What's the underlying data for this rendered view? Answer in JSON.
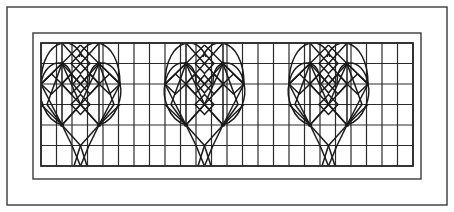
{
  "figure": {
    "kind": "geometric-line-drawing",
    "canvas": {
      "width": 454,
      "height": 212
    },
    "background_color": "#ffffff",
    "line_color": "#1a1a1a",
    "grid_line_color": "#2b2b2b",
    "frame_color": "#3a3a3a"
  },
  "frames": [
    {
      "name": "outer-frame",
      "x": 7,
      "y": 7,
      "width": 440,
      "height": 198,
      "stroke_width": 1.4
    },
    {
      "name": "middle-frame",
      "x": 33,
      "y": 33,
      "width": 388,
      "height": 146,
      "stroke_width": 1.4
    },
    {
      "name": "inner-grid-frame",
      "x": 41,
      "y": 43,
      "width": 372,
      "height": 123,
      "stroke_width": 1.8
    }
  ],
  "grid": {
    "x": 41,
    "y": 43,
    "width": 372,
    "height": 123,
    "columns": 24,
    "rows": 6,
    "cell_width": 15.5,
    "cell_height": 20.5,
    "stroke_width": 1.2
  },
  "motif": {
    "name": "heart-with-diamond-lattice",
    "repeat_count": 3,
    "repeat_period_px": 124,
    "first_origin_x": 41,
    "origin_y": 43,
    "description": "A heart outline formed of arcs and straight chords, filled with a lattice of rotated squares (diamonds) and radiating spokes, with a V-shaped tail dropping below the heart point.",
    "motif_width": 124,
    "motif_height": 123
  },
  "chart_data": {
    "type": "table",
    "xlabel": "",
    "ylabel": "",
    "categories": [
      "motif-1",
      "motif-2",
      "motif-3"
    ],
    "values": [
      1,
      1,
      1
    ],
    "legend": []
  }
}
